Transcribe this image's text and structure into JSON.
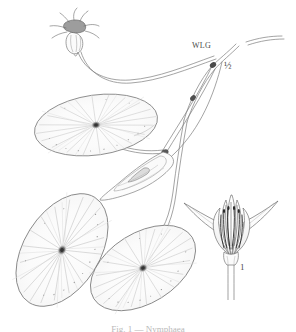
{
  "plate": {
    "title": "Water lily botanical plate",
    "background_color": "#ffffff",
    "ink_color": "#6f6f6f",
    "vein_color": "#c9c9c9",
    "node_color": "#3a3a3a"
  },
  "labels": {
    "monogram": "WLG",
    "scale": "½",
    "figure_one": "1"
  },
  "caption": {
    "text": "Fig. 1 — Nymphaea"
  },
  "icons": {
    "lily_pad": "lily-pad-icon",
    "flower": "flower-icon",
    "bud": "flower-bud-icon",
    "stem": "stem-icon"
  },
  "figure_items": [
    {
      "name": "lily-pad-upper-left",
      "label": "floating leaf"
    },
    {
      "name": "lily-pad-lower-left",
      "label": "floating leaf"
    },
    {
      "name": "lily-pad-lower-right",
      "label": "floating leaf"
    },
    {
      "name": "flower-bud-top",
      "label": "flower on peduncle"
    },
    {
      "name": "flower-detail",
      "label": "flower, longitudinal view"
    },
    {
      "name": "sheathing-leaf",
      "label": "submersed leaf"
    }
  ]
}
